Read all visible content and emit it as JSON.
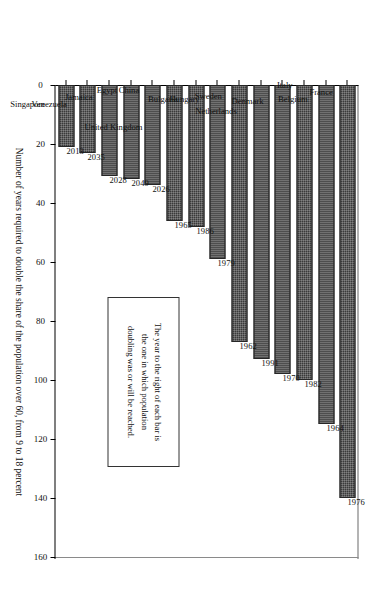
{
  "chart_data": {
    "type": "bar",
    "orientation": "vertical-rotated",
    "title": "",
    "xlabel": "",
    "ylabel": "Number of years required to double the share of the population over 60, from 9 to 18 percent",
    "ylim": [
      0,
      160
    ],
    "yticks": [
      0,
      20,
      40,
      60,
      80,
      100,
      120,
      140,
      160
    ],
    "grid": false,
    "legend": false,
    "categories": [
      "France",
      "Belgium",
      "Italy",
      "Denmark",
      "Netherlands",
      "Sweden",
      "Hungary",
      "Bulgaria",
      "United Kingdom",
      "China",
      "Egypt",
      "Jamaica",
      "Venezuela",
      "Singapore"
    ],
    "values": [
      140,
      115,
      100,
      98,
      93,
      87,
      59,
      48,
      46,
      34,
      32,
      31,
      23,
      21
    ],
    "point_labels": [
      "1976",
      "1964",
      "1982",
      "1970",
      "1991",
      "1962",
      "1979",
      "1986",
      "1965",
      "2026",
      "2049",
      "2028",
      "2035",
      "2013"
    ],
    "annotations": [
      {
        "name": "note-box",
        "lines": [
          "The year to the right of each bar is",
          "the one in which population",
          "doubling was or will be reached."
        ]
      }
    ],
    "colors": {
      "bar_fill": "#3a3a3a",
      "bar_edge": "#262626",
      "axis": "#000000",
      "text": "#111111",
      "background": "#ffffff"
    }
  },
  "axis": {
    "value_label": "Number of years required to double the share of the population over 60, from 9 to 18 percent"
  },
  "note": {
    "line1": "The year to the right of each bar is",
    "line2": "the one in which population",
    "line3": "doubling was or will be reached."
  }
}
